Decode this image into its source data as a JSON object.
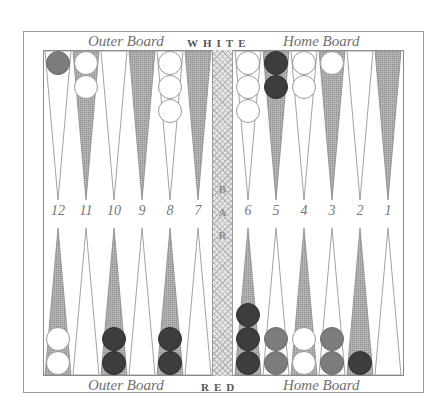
{
  "board": {
    "top_labels": {
      "left": "Outer Board",
      "center": "WHITE",
      "right": "Home Board"
    },
    "bottom_labels": {
      "left": "Outer Board",
      "center": "RED",
      "right": "Home Board"
    },
    "bar_label": [
      "B",
      "A",
      "R"
    ],
    "point_numbers": [
      "12",
      "11",
      "10",
      "9",
      "8",
      "7",
      "6",
      "5",
      "4",
      "3",
      "2",
      "1"
    ],
    "colors": {
      "triangle_shaded": "#9a9a9a",
      "triangle_light": "#ffffff",
      "checker_white": "#ffffff",
      "checker_dark": "#3d3d3d",
      "checker_medium": "#7c7c7c"
    },
    "top_points": [
      {
        "point": "12",
        "shade": "light",
        "checkers": [
          "medium"
        ]
      },
      {
        "point": "11",
        "shade": "shaded",
        "checkers": [
          "white",
          "white"
        ]
      },
      {
        "point": "10",
        "shade": "light",
        "checkers": []
      },
      {
        "point": "9",
        "shade": "shaded",
        "checkers": []
      },
      {
        "point": "8",
        "shade": "light",
        "checkers": [
          "white",
          "white",
          "white"
        ]
      },
      {
        "point": "7",
        "shade": "shaded",
        "checkers": []
      },
      {
        "point": "6",
        "shade": "light",
        "checkers": [
          "white",
          "white",
          "white"
        ]
      },
      {
        "point": "5",
        "shade": "shaded",
        "checkers": [
          "dark",
          "dark"
        ]
      },
      {
        "point": "4",
        "shade": "light",
        "checkers": [
          "white",
          "white"
        ]
      },
      {
        "point": "3",
        "shade": "shaded",
        "checkers": [
          "white"
        ]
      },
      {
        "point": "2",
        "shade": "light",
        "checkers": []
      },
      {
        "point": "1",
        "shade": "shaded",
        "checkers": []
      }
    ],
    "bottom_points": [
      {
        "column": "12",
        "shade": "shaded",
        "checkers": [
          "white",
          "white"
        ]
      },
      {
        "column": "11",
        "shade": "light",
        "checkers": []
      },
      {
        "column": "10",
        "shade": "shaded",
        "checkers": [
          "dark",
          "dark"
        ]
      },
      {
        "column": "9",
        "shade": "light",
        "checkers": []
      },
      {
        "column": "8",
        "shade": "shaded",
        "checkers": [
          "dark",
          "dark"
        ]
      },
      {
        "column": "7",
        "shade": "light",
        "checkers": []
      },
      {
        "column": "6",
        "shade": "shaded",
        "checkers": [
          "dark",
          "dark",
          "dark"
        ]
      },
      {
        "column": "5",
        "shade": "light",
        "checkers": [
          "medium",
          "medium"
        ]
      },
      {
        "column": "4",
        "shade": "shaded",
        "checkers": [
          "white",
          "white"
        ]
      },
      {
        "column": "3",
        "shade": "light",
        "checkers": [
          "medium",
          "medium"
        ]
      },
      {
        "column": "2",
        "shade": "shaded",
        "checkers": [
          "dark"
        ]
      },
      {
        "column": "1",
        "shade": "light",
        "checkers": []
      }
    ]
  }
}
